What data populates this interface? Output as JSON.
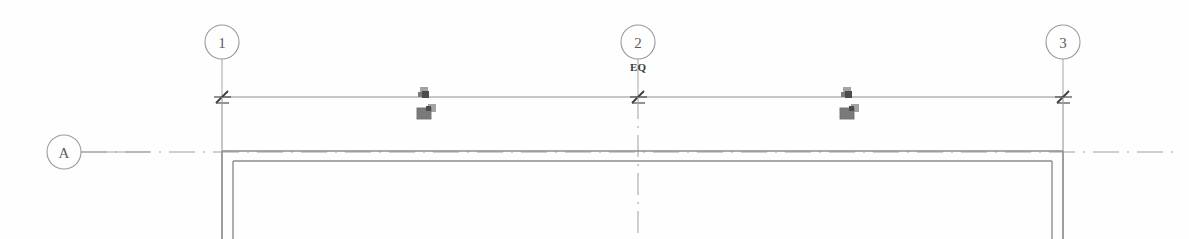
{
  "sheet": {
    "title": "Structural Grid Plan Fragment",
    "background_color": "#fefefe",
    "width": 1189,
    "height": 239
  },
  "grid_bubbles": [
    {
      "label": "1",
      "axis": "vertical",
      "cx": 222,
      "cy": 42,
      "r": 17
    },
    {
      "label": "2",
      "axis": "vertical",
      "cx": 638,
      "cy": 42,
      "r": 17
    },
    {
      "label": "3",
      "axis": "vertical",
      "cx": 1063,
      "cy": 42,
      "r": 17
    },
    {
      "label": "A",
      "axis": "horizontal",
      "cx": 64,
      "cy": 152,
      "r": 17
    }
  ],
  "annotations": [
    {
      "text": "EQ",
      "x": 638,
      "y": 68,
      "note": "equal-spacing dimension label below grid bubble 2"
    }
  ],
  "dimension_line": {
    "y": 97,
    "x_start": 222,
    "x_end": 1063,
    "tick_positions": [
      222,
      638,
      1063
    ],
    "tick_style": "slash"
  },
  "grid_lines": [
    {
      "name": "grid-1",
      "x": 222,
      "style": "solid",
      "y_top": 59,
      "y_bottom": 239
    },
    {
      "name": "grid-2",
      "x": 638,
      "style": "dash-dot",
      "y_top": 59,
      "y_bottom": 239
    },
    {
      "name": "grid-3",
      "x": 1063,
      "style": "solid",
      "y_top": 59,
      "y_bottom": 239
    },
    {
      "name": "grid-A",
      "y": 152,
      "style": "dash-dot",
      "x_start": 81,
      "x_end": 1180
    }
  ],
  "wall_outline": {
    "type": "double-line",
    "outer": {
      "left": 222,
      "right": 1063,
      "top": 151
    },
    "inner": {
      "left": 233,
      "right": 1052,
      "top": 161
    },
    "bottom": 239
  },
  "symbol_markers": [
    {
      "name": "column-tag-upper-left",
      "x": 424,
      "y": 92,
      "size": "small"
    },
    {
      "name": "column-tag-lower-left",
      "x": 424,
      "y": 112,
      "size": "large"
    },
    {
      "name": "column-tag-upper-right",
      "x": 847,
      "y": 92,
      "size": "small"
    },
    {
      "name": "column-tag-lower-right",
      "x": 847,
      "y": 112,
      "size": "large"
    }
  ],
  "colors": {
    "line_gray": "#9a9a9a",
    "tick_dark": "#3c3c3c",
    "text_gray": "#5d5d5d",
    "marker_dark": "#4c4c4c",
    "paper": "#fefefe"
  }
}
